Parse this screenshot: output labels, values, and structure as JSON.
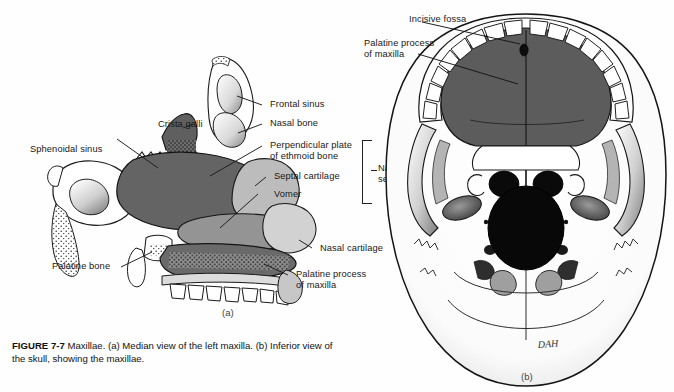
{
  "figure": {
    "number": "FIGURE 7-7",
    "caption_body": "  Maxillae. (a) Median view of the left maxilla. (b) Inferior view of the skull, showing the maxillae.",
    "panel_a_letter": "(a)",
    "panel_b_letter": "(b)",
    "artist_signature": "DAH"
  },
  "panel_a": {
    "title": "Median view of the left maxilla",
    "labels": [
      {
        "id": "crista-galli",
        "text": "Crista galli"
      },
      {
        "id": "sphenoidal-sinus",
        "text": "Sphenoidal sinus"
      },
      {
        "id": "palatine-bone",
        "text": "Palatine bone"
      },
      {
        "id": "frontal-sinus",
        "text": "Frontal sinus"
      },
      {
        "id": "nasal-bone",
        "text": "Nasal bone"
      },
      {
        "id": "perpendicular-plate",
        "text": "Perpendicular plate\nof ethmoid bone"
      },
      {
        "id": "septal-cartilage",
        "text": "Septal cartilage"
      },
      {
        "id": "vomer",
        "text": "Vomer"
      },
      {
        "id": "nasal-cartilage",
        "text": "Nasal cartilage"
      },
      {
        "id": "palatine-process",
        "text": "Palatine process\nof maxilla"
      },
      {
        "id": "nasal-septum",
        "text": "Nasal\nseptum"
      }
    ],
    "bracket_groups": [
      {
        "id": "nasal-septum-bracket",
        "label": "Nasal septum",
        "members": [
          "Perpendicular plate of ethmoid bone",
          "Septal cartilage",
          "Vomer"
        ]
      }
    ]
  },
  "panel_b": {
    "title": "Inferior view of the skull, showing the maxillae",
    "labels": [
      {
        "id": "incisive-fossa",
        "text": "Incisive fossa"
      },
      {
        "id": "palatine-process-b",
        "text": "Palatine process\nof maxilla"
      }
    ]
  },
  "colors": {
    "background": "#fefefe",
    "ink": "#181818",
    "bone_white": "#ffffff",
    "cartilage_light_gray": "#b9b9b9",
    "septum_mid_gray": "#8e8e8e",
    "ethmoid_dark_gray": "#636363",
    "palate_dark": "#5a5a5a",
    "foramen_black": "#0b0b0b",
    "shadow_gray": "#cfcfcf"
  }
}
